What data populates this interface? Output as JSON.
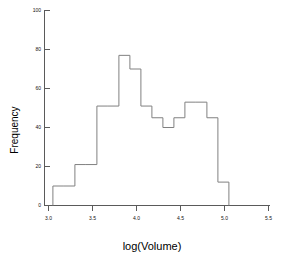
{
  "chart_data": {
    "type": "bar",
    "subtype": "histogram-outline",
    "title": "",
    "xlabel": "log(Volume)",
    "ylabel": "Frequency",
    "xlim": [
      3.0,
      5.5
    ],
    "ylim": [
      0,
      100
    ],
    "xticks": [
      3.0,
      3.5,
      4.0,
      4.5,
      5.0,
      5.5
    ],
    "xtick_labels": [
      "3.0",
      "3.5",
      "4.0",
      "4.5",
      "5.0",
      "5.5"
    ],
    "yticks": [
      0,
      20,
      40,
      60,
      80,
      100
    ],
    "ytick_labels": [
      "0",
      "20",
      "40",
      "60",
      "80",
      "100"
    ],
    "grid": false,
    "legend": null,
    "bin_width": 0.125,
    "bin_edges": [
      3.05,
      3.175,
      3.3,
      3.425,
      3.55,
      3.675,
      3.8,
      3.925,
      4.05,
      4.175,
      4.3,
      4.425,
      4.55,
      4.675,
      4.8,
      4.925,
      5.05
    ],
    "categories": [
      "3.05-3.175",
      "3.175-3.30",
      "3.30-3.425",
      "3.425-3.55",
      "3.55-3.675",
      "3.675-3.80",
      "3.80-3.925",
      "3.925-4.05",
      "4.05-4.175",
      "4.175-4.30",
      "4.30-4.425",
      "4.425-4.55",
      "4.55-4.675",
      "4.675-4.80",
      "4.80-4.925",
      "4.925-5.05"
    ],
    "values": [
      10,
      10,
      21,
      21,
      51,
      51,
      77,
      70,
      51,
      45,
      40,
      45,
      53,
      53,
      45,
      12
    ],
    "series": [
      {
        "name": "Frequency",
        "values": [
          10,
          10,
          21,
          21,
          51,
          51,
          77,
          70,
          51,
          45,
          40,
          45,
          53,
          53,
          45,
          12
        ]
      }
    ],
    "line_color": "#808080",
    "axis_color": "#5a5a5a"
  },
  "axes": {
    "x_label": "log(Volume)",
    "y_label": "Frequency",
    "x_ticks": [
      "3.0",
      "3.5",
      "4.0",
      "4.5",
      "5.0",
      "5.5"
    ],
    "y_ticks": [
      "100",
      "80",
      "60",
      "40",
      "20",
      "0"
    ]
  },
  "colors": {
    "background": "#ffffff",
    "line": "#808080",
    "axis": "#5a5a5a",
    "text": "#111111"
  }
}
